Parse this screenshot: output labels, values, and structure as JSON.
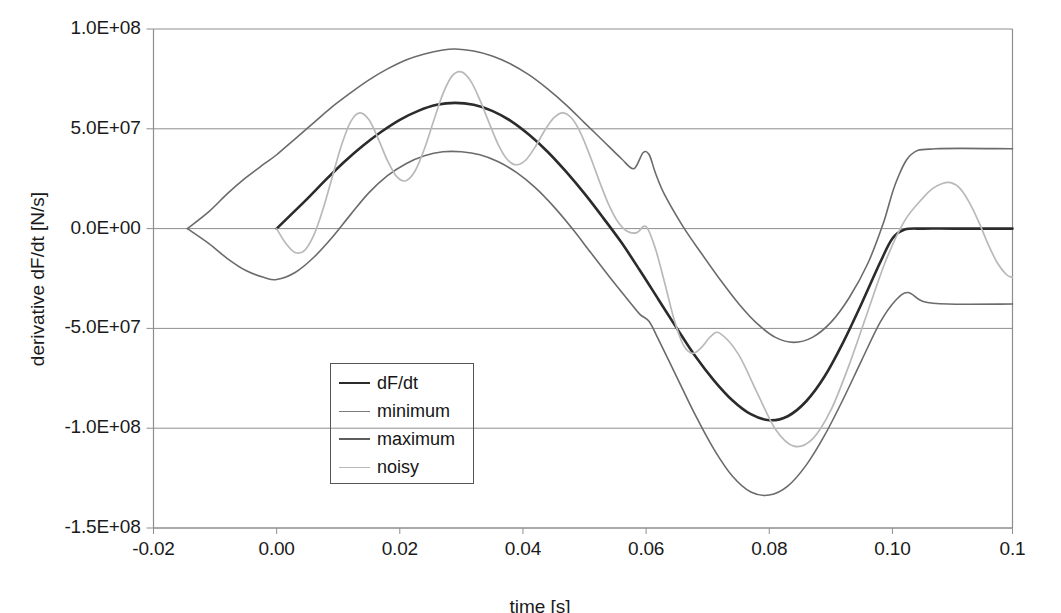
{
  "chart_data": {
    "type": "line",
    "title": "",
    "xlabel": "time [s]",
    "ylabel": "derivative dF/dt [N/s]",
    "xlim": [
      -0.02,
      0.1195
    ],
    "ylim": [
      -150000000,
      100000000
    ],
    "grid": true,
    "legend_position": "center-left-inside",
    "xticks": [
      -0.02,
      0.0,
      0.02,
      0.04,
      0.06,
      0.08,
      0.1,
      0.1195
    ],
    "xticklabels": [
      "-0.02",
      "0.00",
      "0.02",
      "0.04",
      "0.06",
      "0.08",
      "0.10",
      "0.1"
    ],
    "yticks": [
      100000000,
      50000000,
      0,
      -50000000,
      -100000000,
      -150000000
    ],
    "yticklabels": [
      "1.0E+08",
      "5.0E+07",
      "0.0E+00",
      "-5.0E+07",
      "-1.0E+08",
      "-1.5E+08"
    ],
    "series": [
      {
        "name": "dF/dt",
        "color": "#2b2b2b",
        "width": 2.6,
        "x": [
          0.0,
          0.002,
          0.005,
          0.008,
          0.011,
          0.014,
          0.017,
          0.02,
          0.023,
          0.026,
          0.029,
          0.032,
          0.035,
          0.038,
          0.041,
          0.044,
          0.047,
          0.05,
          0.053,
          0.056,
          0.059,
          0.062,
          0.065,
          0.068,
          0.071,
          0.074,
          0.077,
          0.08,
          0.083,
          0.086,
          0.089,
          0.092,
          0.095,
          0.098,
          0.1,
          0.102,
          0.105,
          0.11,
          0.1195
        ],
        "y": [
          0,
          6000000,
          15000000,
          24500000,
          33500000,
          41500000,
          48500000,
          54500000,
          59000000,
          62000000,
          63000000,
          62000000,
          59000000,
          54000000,
          47000000,
          38500000,
          28500000,
          17500000,
          5500000,
          -7000000,
          -21000000,
          -35500000,
          -50000000,
          -64000000,
          -76000000,
          -86000000,
          -93000000,
          -96000000,
          -94000000,
          -86500000,
          -74000000,
          -57000000,
          -37500000,
          -17000000,
          -5000000,
          -500000,
          0,
          0,
          0
        ]
      },
      {
        "name": "maximum",
        "color": "#6b6b6b",
        "width": 1.6,
        "x": [
          -0.0145,
          -0.011,
          -0.008,
          -0.005,
          -0.002,
          0.0,
          0.003,
          0.006,
          0.009,
          0.012,
          0.015,
          0.018,
          0.021,
          0.024,
          0.027,
          0.029,
          0.032,
          0.035,
          0.038,
          0.041,
          0.044,
          0.047,
          0.05,
          0.053,
          0.056,
          0.058,
          0.0595,
          0.0605,
          0.0615,
          0.063,
          0.066,
          0.069,
          0.072,
          0.075,
          0.078,
          0.081,
          0.084,
          0.087,
          0.09,
          0.093,
          0.096,
          0.0985,
          0.1005,
          0.103,
          0.107,
          0.1195
        ],
        "y": [
          0,
          8500000,
          17500000,
          25500000,
          32500000,
          37000000,
          45000000,
          53000000,
          61000000,
          68000000,
          74500000,
          80000000,
          84500000,
          87500000,
          89500000,
          90000000,
          89000000,
          86500000,
          82500000,
          77000000,
          70000000,
          62000000,
          53000000,
          44000000,
          35000000,
          30000000,
          38000000,
          37000000,
          28000000,
          17000000,
          1000000,
          -12500000,
          -25500000,
          -37500000,
          -47500000,
          -54500000,
          -57000000,
          -54500000,
          -47000000,
          -34500000,
          -17500000,
          2500000,
          22500000,
          37000000,
          40000000,
          40000000
        ]
      },
      {
        "name": "minimum",
        "color": "#6b6b6b",
        "width": 1.6,
        "x": [
          -0.0145,
          -0.011,
          -0.008,
          -0.005,
          -0.002,
          0.0,
          0.003,
          0.006,
          0.009,
          0.012,
          0.015,
          0.018,
          0.021,
          0.024,
          0.027,
          0.03,
          0.033,
          0.036,
          0.039,
          0.042,
          0.045,
          0.048,
          0.051,
          0.054,
          0.057,
          0.059,
          0.0605,
          0.062,
          0.065,
          0.068,
          0.071,
          0.074,
          0.077,
          0.08,
          0.083,
          0.086,
          0.089,
          0.092,
          0.095,
          0.098,
          0.1005,
          0.1025,
          0.105,
          0.109,
          0.1195
        ],
        "y": [
          0,
          -7500000,
          -15000000,
          -21000000,
          -24500000,
          -25500000,
          -22000000,
          -14500000,
          -4500000,
          7000000,
          18000000,
          26500000,
          32500000,
          36500000,
          38500000,
          38500000,
          37000000,
          33500000,
          28000000,
          20500000,
          11000000,
          0,
          -12000000,
          -24000000,
          -35500000,
          -43000000,
          -46500000,
          -55500000,
          -74500000,
          -93500000,
          -110500000,
          -124000000,
          -132000000,
          -133500000,
          -129000000,
          -118500000,
          -103500000,
          -85500000,
          -66000000,
          -47000000,
          -36000000,
          -32000000,
          -36500000,
          -37800000,
          -37800000
        ]
      },
      {
        "name": "noisy",
        "color": "#b9b9b9",
        "width": 1.7,
        "x": [
          0.0,
          0.0015,
          0.003,
          0.0045,
          0.006,
          0.0075,
          0.009,
          0.0105,
          0.012,
          0.0135,
          0.015,
          0.0165,
          0.018,
          0.0195,
          0.021,
          0.0225,
          0.024,
          0.0255,
          0.027,
          0.0285,
          0.03,
          0.0315,
          0.033,
          0.0345,
          0.036,
          0.0375,
          0.039,
          0.0405,
          0.042,
          0.0435,
          0.045,
          0.0465,
          0.048,
          0.0495,
          0.051,
          0.0525,
          0.054,
          0.0555,
          0.057,
          0.0585,
          0.06,
          0.0615,
          0.063,
          0.0645,
          0.066,
          0.0675,
          0.069,
          0.0705,
          0.072,
          0.075,
          0.078,
          0.081,
          0.084,
          0.087,
          0.09,
          0.093,
          0.096,
          0.099,
          0.102,
          0.105,
          0.1065,
          0.108,
          0.1095,
          0.111,
          0.1125,
          0.114,
          0.1155,
          0.117,
          0.1185,
          0.1195
        ],
        "y": [
          0,
          -7500000,
          -12000000,
          -11000000,
          -3500000,
          9500000,
          25500000,
          41500000,
          53500000,
          58000000,
          54500000,
          45000000,
          34000000,
          26000000,
          24000000,
          29000000,
          40000000,
          54000000,
          67500000,
          76500000,
          78500000,
          74000000,
          64500000,
          53000000,
          42000000,
          34500000,
          32000000,
          34500000,
          41000000,
          49000000,
          55500000,
          58000000,
          55000000,
          47000000,
          35500000,
          23000000,
          11500000,
          3000000,
          -1500000,
          -2000000,
          1000000,
          -10000000,
          -27000000,
          -45000000,
          -58000000,
          -62500000,
          -59500000,
          -54000000,
          -52500000,
          -63000000,
          -82000000,
          -100500000,
          -109000000,
          -105500000,
          -91000000,
          -68000000,
          -41500000,
          -15500000,
          4000000,
          15500000,
          20000000,
          22500000,
          23000000,
          20000000,
          13000000,
          3500000,
          -7500000,
          -17000000,
          -23000000,
          -24500000
        ]
      }
    ]
  },
  "axes": {
    "y_title": "derivative dF/dt [N/s]",
    "x_title": "time [s]"
  },
  "legend": {
    "items": [
      {
        "label": "dF/dt",
        "color": "#2b2b2b",
        "width": "2.6px"
      },
      {
        "label": "minimum",
        "color": "#7d7d7d",
        "width": "1.7px"
      },
      {
        "label": "maximum",
        "color": "#5d5d5d",
        "width": "2.2px"
      },
      {
        "label": "noisy",
        "color": "#b9b9b9",
        "width": "1.7px"
      }
    ]
  }
}
